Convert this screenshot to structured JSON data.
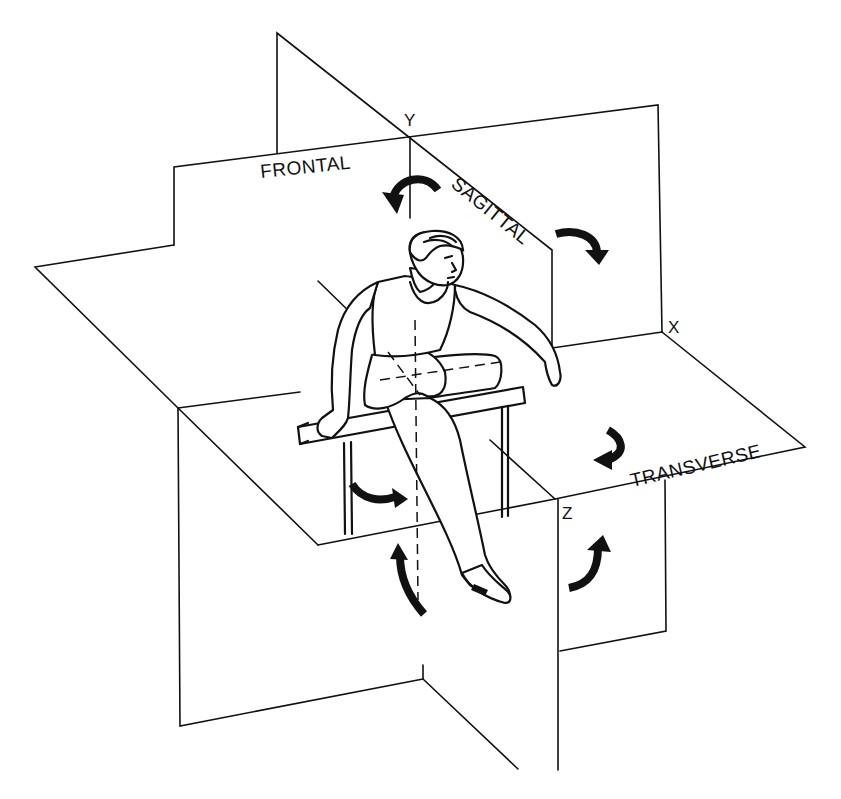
{
  "figure": {
    "colors": {
      "ink": "#111111",
      "background": "#ffffff"
    }
  },
  "planes": {
    "frontal": {
      "label": "FRONTAL"
    },
    "sagittal": {
      "label": "SAGITTAL"
    },
    "transverse": {
      "label": "TRANSVERSE"
    }
  },
  "axes": {
    "x": {
      "label": "X"
    },
    "y": {
      "label": "Y"
    },
    "z": {
      "label": "Z"
    }
  },
  "arrows": [
    {
      "id": "sagittal-upper-left",
      "plane": "sagittal",
      "icon": "curved-arrow-down-left"
    },
    {
      "id": "frontal-upper-right",
      "plane": "frontal",
      "icon": "curved-arrow-down-right"
    },
    {
      "id": "transverse-right",
      "plane": "transverse",
      "icon": "curved-arrow-left"
    },
    {
      "id": "transverse-left",
      "plane": "transverse",
      "icon": "curved-arrow-right"
    },
    {
      "id": "sagittal-lower",
      "plane": "sagittal",
      "icon": "curved-arrow-up"
    },
    {
      "id": "frontal-lower-right",
      "plane": "frontal",
      "icon": "curved-arrow-up-right"
    }
  ],
  "figure_subject": {
    "description": "Athlete clearing a hurdle"
  }
}
